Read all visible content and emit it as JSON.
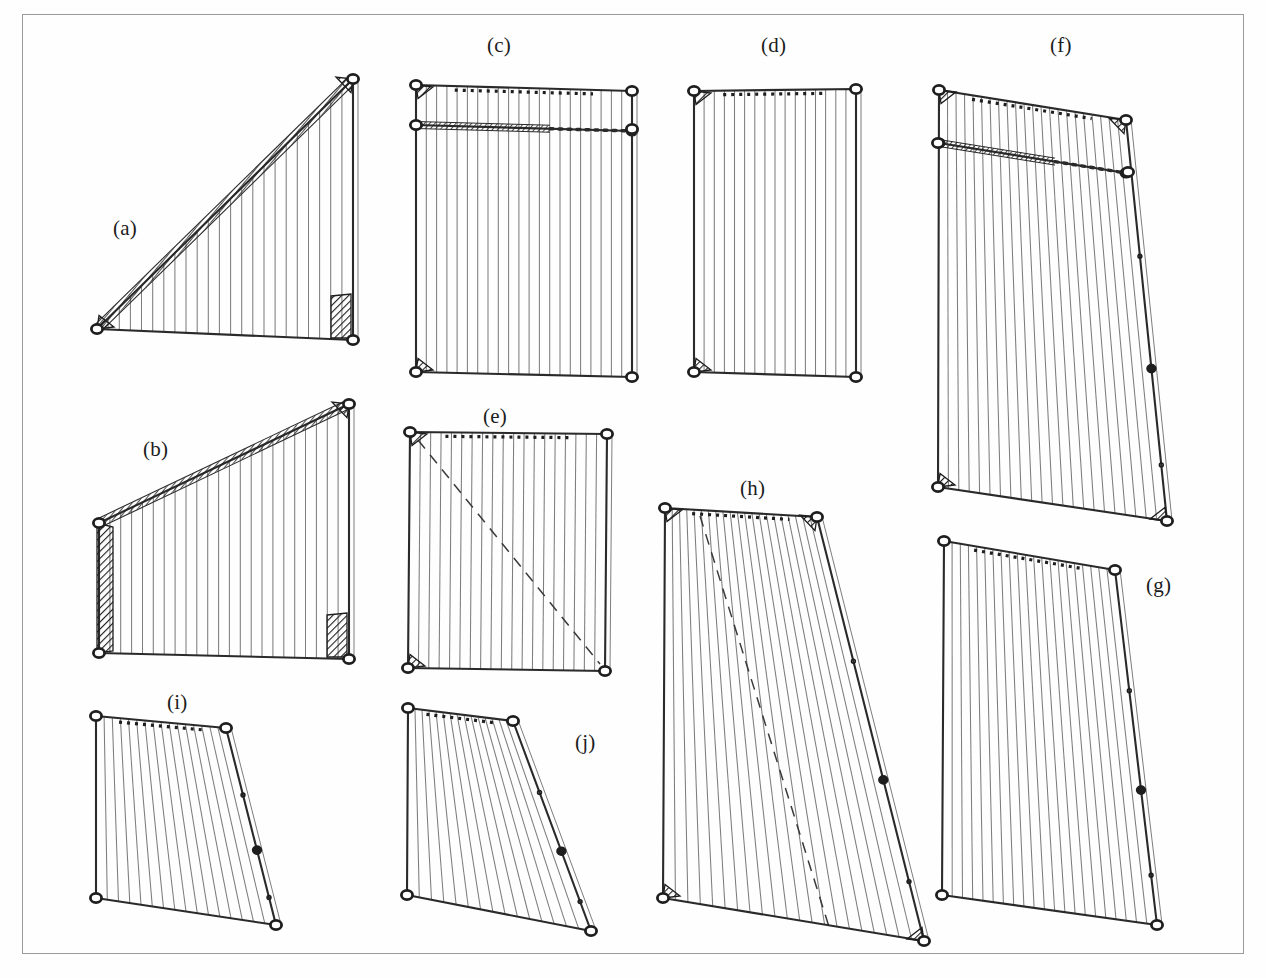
{
  "figure": {
    "kind": "engineering-plate",
    "background_color": "#fefefe",
    "border_color": "#9a9a9a",
    "ink_color": "#2a2a2a",
    "mesh_color": "#7d7d7d",
    "hatch_color": "#1e1e1e",
    "caption_font_size_px": 21
  },
  "panels": [
    {
      "id": "a",
      "label": "(a)",
      "label_x": 113,
      "label_y": 216,
      "shape": "right-triangle",
      "outline": [
        [
          97,
          329
        ],
        [
          353,
          79
        ],
        [
          353,
          340
        ]
      ],
      "mesh_lines": 22,
      "mesh_axis": "vertical",
      "top_member": "twisted-rope",
      "diagonal_dashed": false,
      "gussets": [
        "bottom-left",
        "top-right",
        "bottom-right-block"
      ],
      "eyelets": [
        [
          97,
          329
        ],
        [
          353,
          79
        ],
        [
          353,
          340
        ]
      ]
    },
    {
      "id": "b",
      "label": "(b)",
      "label_x": 143,
      "label_y": 437,
      "shape": "trapezoid-sloped-top",
      "outline": [
        [
          99,
          523
        ],
        [
          349,
          404
        ],
        [
          349,
          659
        ],
        [
          99,
          653
        ]
      ],
      "mesh_lines": 22,
      "mesh_axis": "vertical",
      "top_member": "twisted-rope",
      "diagonal_dashed": false,
      "gussets": [
        "left-tall-block",
        "top-right",
        "bottom-right-block"
      ],
      "eyelets": [
        [
          99,
          523
        ],
        [
          349,
          404
        ],
        [
          349,
          659
        ],
        [
          99,
          653
        ]
      ]
    },
    {
      "id": "c",
      "label": "(c)",
      "label_x": 487,
      "label_y": 33,
      "shape": "rectangle",
      "outline": [
        [
          416,
          85
        ],
        [
          632,
          91
        ],
        [
          632,
          377
        ],
        [
          416,
          372
        ]
      ],
      "mesh_lines": 20,
      "mesh_axis": "vertical",
      "top_member": "dotted-rail",
      "inner_rail_y": 125,
      "inner_rail_style": "hatched-left-dotted-right",
      "diagonal_dashed": false,
      "gussets": [
        "top-left",
        "bottom-left"
      ],
      "eyelets": [
        [
          416,
          85
        ],
        [
          632,
          91
        ],
        [
          632,
          377
        ],
        [
          416,
          372
        ],
        [
          416,
          125
        ],
        [
          632,
          129
        ]
      ]
    },
    {
      "id": "d",
      "label": "(d)",
      "label_x": 761,
      "label_y": 33,
      "shape": "rectangle",
      "outline": [
        [
          694,
          91
        ],
        [
          856,
          89
        ],
        [
          856,
          377
        ],
        [
          694,
          372
        ]
      ],
      "mesh_lines": 15,
      "mesh_axis": "vertical",
      "top_member": "dotted-rail",
      "diagonal_dashed": false,
      "gussets": [
        "top-left",
        "bottom-left"
      ],
      "eyelets": [
        [
          694,
          91
        ],
        [
          856,
          89
        ],
        [
          856,
          377
        ],
        [
          694,
          372
        ]
      ]
    },
    {
      "id": "e",
      "label": "(e)",
      "label_x": 483,
      "label_y": 404,
      "shape": "rectangle",
      "outline": [
        [
          410,
          432
        ],
        [
          607,
          434
        ],
        [
          605,
          671
        ],
        [
          408,
          668
        ]
      ],
      "mesh_lines": 18,
      "mesh_axis": "vertical",
      "top_member": "dotted-rail",
      "diagonal_dashed": true,
      "diagonal_from": [
        418,
        440
      ],
      "diagonal_to": [
        600,
        664
      ],
      "gussets": [
        "top-left",
        "bottom-left"
      ],
      "eyelets": [
        [
          410,
          432
        ],
        [
          607,
          434
        ],
        [
          605,
          671
        ],
        [
          408,
          668
        ]
      ]
    },
    {
      "id": "f",
      "label": "(f)",
      "label_x": 1050,
      "label_y": 33,
      "shape": "trapezoid-sloped-right",
      "outline": [
        [
          939,
          90
        ],
        [
          1126,
          120
        ],
        [
          1167,
          521
        ],
        [
          938,
          487
        ]
      ],
      "mesh_lines": 21,
      "mesh_axis": "vertical",
      "top_member": "dotted-rail",
      "inner_rail_y": 143,
      "inner_rail_style": "twisted-rope",
      "diagonal_dashed": false,
      "gussets": [
        "top-left",
        "top-right",
        "bottom-left",
        "bottom-right"
      ],
      "eyelets": [
        [
          939,
          90
        ],
        [
          1126,
          120
        ],
        [
          1167,
          521
        ],
        [
          938,
          487
        ],
        [
          938,
          143
        ],
        [
          1128,
          172
        ]
      ]
    },
    {
      "id": "g",
      "label": "(g)",
      "label_x": 1146,
      "label_y": 573,
      "shape": "trapezoid-sloped-right",
      "outline": [
        [
          944,
          541
        ],
        [
          1115,
          570
        ],
        [
          1157,
          925
        ],
        [
          942,
          895
        ]
      ],
      "mesh_lines": 20,
      "mesh_axis": "vertical",
      "top_member": "dotted-rail",
      "diagonal_dashed": false,
      "gussets": [],
      "eyelets": [
        [
          944,
          541
        ],
        [
          1115,
          570
        ],
        [
          1157,
          925
        ],
        [
          942,
          895
        ]
      ]
    },
    {
      "id": "h",
      "label": "(h)",
      "label_x": 740,
      "label_y": 476,
      "shape": "trapezoid-sloped-right",
      "outline": [
        [
          665,
          508
        ],
        [
          817,
          517
        ],
        [
          924,
          941
        ],
        [
          663,
          898
        ]
      ],
      "mesh_lines": 20,
      "mesh_axis": "vertical",
      "top_member": "dotted-rail",
      "diagonal_dashed": true,
      "diagonal_from": [
        700,
        516
      ],
      "diagonal_to": [
        830,
        930
      ],
      "gussets": [
        "top-left",
        "top-right",
        "bottom-left",
        "bottom-right"
      ],
      "eyelets": [
        [
          665,
          508
        ],
        [
          817,
          517
        ],
        [
          924,
          941
        ],
        [
          663,
          898
        ]
      ]
    },
    {
      "id": "i",
      "label": "(i)",
      "label_x": 167,
      "label_y": 690,
      "shape": "trapezoid-sloped-right",
      "outline": [
        [
          96,
          716
        ],
        [
          226,
          728
        ],
        [
          276,
          925
        ],
        [
          96,
          898
        ]
      ],
      "mesh_lines": 15,
      "mesh_axis": "vertical",
      "top_member": "dotted-rail",
      "diagonal_dashed": false,
      "gussets": [],
      "eyelets": [
        [
          96,
          716
        ],
        [
          226,
          728
        ],
        [
          276,
          925
        ],
        [
          96,
          898
        ]
      ]
    },
    {
      "id": "j",
      "label": "(j)",
      "label_x": 575,
      "label_y": 730,
      "shape": "trapezoid-sloped-right",
      "outline": [
        [
          408,
          708
        ],
        [
          513,
          721
        ],
        [
          591,
          931
        ],
        [
          407,
          895
        ]
      ],
      "mesh_lines": 14,
      "mesh_axis": "vertical",
      "top_member": "dotted-rail",
      "diagonal_dashed": false,
      "gussets": [],
      "eyelets": [
        [
          408,
          708
        ],
        [
          513,
          721
        ],
        [
          591,
          931
        ],
        [
          407,
          895
        ]
      ]
    }
  ]
}
